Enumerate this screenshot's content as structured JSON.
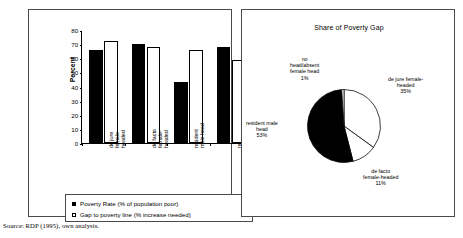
{
  "source_note": "Source: RDP (1995), own analysis.",
  "bar_chart": {
    "ylabel": "Percent",
    "legend": [
      {
        "label": "Poverty Rate (% of population poor)",
        "swatch": "dark"
      },
      {
        "label": "Gap to poverty line (% increase needed)",
        "swatch": "light"
      }
    ]
  },
  "pie_chart": {
    "title": "Share of Poverty Gap"
  },
  "chart_data": [
    {
      "type": "bar",
      "title": "",
      "xlabel": "",
      "ylabel": "Percent",
      "ylim": [
        0,
        80
      ],
      "yticks": [
        0,
        10,
        20,
        30,
        40,
        50,
        60,
        70,
        80
      ],
      "grid": false,
      "legend_position": "below-plot",
      "categories": [
        "de jure female-headed",
        "de facto female-headed",
        "resident male head",
        "no head/absent female head"
      ],
      "series": [
        {
          "name": "Poverty Rate (% of population poor)",
          "color": "#000000",
          "values": [
            66,
            70,
            43,
            68
          ]
        },
        {
          "name": "Gap to poverty line (% increase needed)",
          "color": "#ffffff",
          "values": [
            72,
            68,
            66,
            59
          ]
        }
      ]
    },
    {
      "type": "pie",
      "title": "Share of Poverty Gap",
      "labels": [
        "de jure female-headed",
        "de facto female-headed",
        "resident male head",
        "no head/absent female head"
      ],
      "values": [
        35,
        11,
        53,
        1
      ],
      "value_labels": [
        "35%",
        "11%",
        "53%",
        "1%"
      ],
      "colors": [
        "#ffffff",
        "#ffffff",
        "#000000",
        "#ffffff"
      ],
      "legend_position": "callout-labels"
    }
  ],
  "pie_labels": [
    {
      "name": "no head/absent female head",
      "pct": "1%",
      "lines": [
        "no",
        "head/absent",
        "female head",
        "1%"
      ]
    },
    {
      "name": "de jure female-headed",
      "pct": "35%",
      "lines": [
        "de jure female-",
        "headed",
        "35%"
      ]
    },
    {
      "name": "de facto female-headed",
      "pct": "11%",
      "lines": [
        "de facto",
        "female-headed",
        "11%"
      ]
    },
    {
      "name": "resident male head",
      "pct": "53%",
      "lines": [
        "resident male",
        "head",
        "53%"
      ]
    }
  ]
}
